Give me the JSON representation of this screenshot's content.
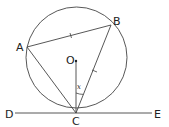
{
  "diagram": {
    "points": {
      "A": {
        "label": "A",
        "x": 27,
        "y": 47
      },
      "B": {
        "label": "B",
        "x": 111,
        "y": 25
      },
      "O": {
        "label": "O",
        "x": 76,
        "y": 61
      },
      "C": {
        "label": "C",
        "x": 76,
        "y": 113
      },
      "D": {
        "label": "D",
        "x": 15,
        "y": 113
      },
      "E": {
        "label": "E",
        "x": 152,
        "y": 113
      }
    },
    "circle": {
      "cx": 76.5,
      "cy": 57.5,
      "r": 50.5
    },
    "angle_label": "x",
    "colors": {
      "stroke": "#333333",
      "text": "#222222"
    }
  }
}
